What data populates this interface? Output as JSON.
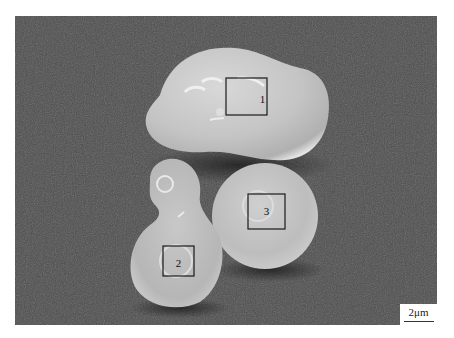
{
  "image": {
    "type": "SEM micrograph",
    "description": "Three smooth particles on a textured substrate with marked analysis regions",
    "background_color": "#4b4b4b"
  },
  "regions": [
    {
      "label": "1",
      "box": {
        "x": 226,
        "y": 78,
        "w": 41,
        "h": 37
      }
    },
    {
      "label": "2",
      "box": {
        "x": 163,
        "y": 246,
        "w": 31,
        "h": 30
      }
    },
    {
      "label": "3",
      "box": {
        "x": 248,
        "y": 194,
        "w": 37,
        "h": 35
      }
    }
  ],
  "scale_bar": {
    "label": "2μm"
  }
}
